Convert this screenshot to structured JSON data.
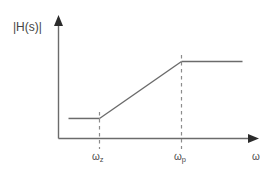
{
  "figure": {
    "background_color": "#ffffff",
    "line_color": "#6b6b6b",
    "axis_color": "#6b6b6b",
    "dash_color": "#8c8c8c",
    "text_color": "#444444"
  },
  "axes": {
    "y_label": "|H(s)|",
    "x_label": "ω",
    "x_axis_has_arrow": true,
    "y_axis_has_arrow": true
  },
  "ticks": {
    "wz": {
      "omega": "ω",
      "sub": "z"
    },
    "wp": {
      "omega": "ω",
      "sub": "p"
    }
  },
  "chart_data": {
    "type": "line",
    "title": "",
    "subtitle": "",
    "xlabel": "ω",
    "ylabel": "|H(s)|",
    "grid": false,
    "legend": null,
    "xlim": [
      0,
      1
    ],
    "ylim": [
      0,
      1
    ],
    "xticks": [
      "ωz",
      "ωp"
    ],
    "xtick_values": [
      0.205,
      0.615
    ],
    "yticks": [],
    "annotations": [
      {
        "text": "ωz",
        "type": "x-tick-dashed-line",
        "x": 0.205
      },
      {
        "text": "ωp",
        "type": "x-tick-dashed-line",
        "x": 0.615
      }
    ],
    "series": [
      {
        "name": "|H(s)| asymptote",
        "x": [
          0.05,
          0.205,
          0.615,
          0.92
        ],
        "y": [
          0.167,
          0.167,
          0.642,
          0.642
        ],
        "segments": [
          {
            "name": "low-frequency-plateau",
            "x0": 0.05,
            "y0": 0.167,
            "x1": 0.205,
            "y1": 0.167,
            "slope": 0
          },
          {
            "name": "rising-slope",
            "x0": 0.205,
            "y0": 0.167,
            "x1": 0.615,
            "y1": 0.642,
            "slope": "positive"
          },
          {
            "name": "high-frequency-plateau",
            "x0": 0.615,
            "y0": 0.642,
            "x1": 0.92,
            "y1": 0.642,
            "slope": 0
          }
        ]
      }
    ]
  }
}
